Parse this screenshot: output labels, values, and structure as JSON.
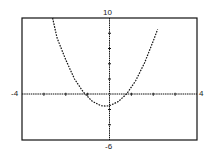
{
  "chart_data": {
    "type": "line",
    "title": "",
    "xlabel": "",
    "ylabel": "",
    "xlim": [
      -4,
      4
    ],
    "ylim": [
      -6,
      10
    ],
    "grid": false,
    "tick_labels": {
      "xmin": "-4",
      "xmax": "4",
      "ymax": "10",
      "ymin": "-6"
    },
    "x_ticks": [
      -3,
      -2,
      -1,
      1,
      2,
      3
    ],
    "y_ticks": [
      -4,
      -2,
      2,
      4,
      6,
      8
    ],
    "series": [
      {
        "name": "parabola",
        "style": "dotted",
        "x": [
          -2.6,
          -2.4,
          -2.0,
          -1.6,
          -1.2,
          -0.8,
          -0.4,
          -0.17,
          0.0,
          0.4,
          0.8,
          1.2,
          1.6,
          2.0,
          2.2
        ],
        "y": [
          10.1,
          7.4,
          4.5,
          2.0,
          0.3,
          -0.9,
          -1.5,
          -1.55,
          -1.5,
          -0.97,
          0.1,
          1.8,
          4.1,
          7.0,
          8.5
        ]
      }
    ]
  }
}
